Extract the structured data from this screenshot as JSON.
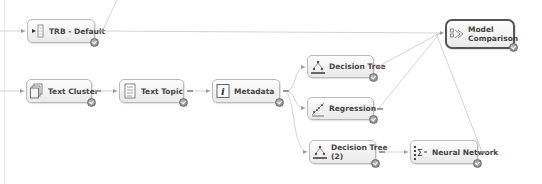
{
  "diagram": {
    "nodes": [
      {
        "id": "trb",
        "label": "TRB - Default",
        "icon": "data-source-icon",
        "selected": false
      },
      {
        "id": "text_cluster",
        "label": "Text Cluster",
        "icon": "text-cluster-icon",
        "selected": false
      },
      {
        "id": "text_topic",
        "label": "Text Topic",
        "icon": "text-topic-icon",
        "selected": false
      },
      {
        "id": "metadata",
        "label": "Metadata",
        "icon": "metadata-icon",
        "selected": false
      },
      {
        "id": "decision_tree",
        "label": "Decision Tree",
        "icon": "decision-tree-icon",
        "selected": false
      },
      {
        "id": "regression",
        "label": "Regression",
        "icon": "regression-icon",
        "selected": false
      },
      {
        "id": "decision_tree_2",
        "label_line1": "Decision Tree",
        "label_line2": "(2)",
        "icon": "decision-tree-icon",
        "selected": false
      },
      {
        "id": "neural_network",
        "label": "Neural Network",
        "icon": "neural-network-icon",
        "selected": false
      },
      {
        "id": "model_comparison",
        "label_line1": "Model",
        "label_line2": "Comparison",
        "icon": "model-comparison-icon",
        "selected": true
      }
    ],
    "edges": [
      [
        "input",
        "trb"
      ],
      [
        "trb",
        "model_comparison"
      ],
      [
        "input",
        "text_cluster"
      ],
      [
        "text_cluster",
        "text_topic"
      ],
      [
        "text_topic",
        "metadata"
      ],
      [
        "metadata",
        "decision_tree"
      ],
      [
        "metadata",
        "regression"
      ],
      [
        "metadata",
        "decision_tree_2"
      ],
      [
        "decision_tree",
        "model_comparison"
      ],
      [
        "regression",
        "model_comparison"
      ],
      [
        "decision_tree_2",
        "neural_network"
      ],
      [
        "neural_network",
        "model_comparison"
      ]
    ],
    "colors": {
      "node_border": "#b9b9b9",
      "selected_border": "#555555",
      "edge": "#c8c8c8",
      "label": "#444444"
    }
  }
}
